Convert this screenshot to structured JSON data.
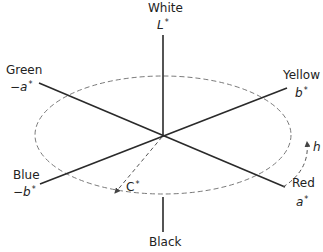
{
  "diagram": {
    "axes": {
      "lightness": {
        "top_label": "White",
        "top_symbol": "L",
        "bottom_label": "Black"
      },
      "a_positive": {
        "label": "Red",
        "symbol": "a"
      },
      "a_negative": {
        "label": "Green",
        "symbol": "−a"
      },
      "b_positive": {
        "label": "Yellow",
        "symbol": "b"
      },
      "b_negative": {
        "label": "Blue",
        "symbol": "−b"
      }
    },
    "chroma": {
      "symbol": "C"
    },
    "hue": {
      "symbol": "h"
    },
    "star": "*",
    "colors": {
      "line": "#2a2a2a",
      "dashed": "#7a7a7a",
      "background": "#ffffff"
    }
  }
}
